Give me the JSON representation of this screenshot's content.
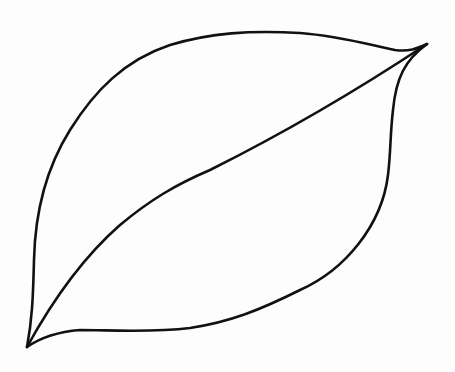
{
  "drawing": {
    "subject": "leaf outline with midrib",
    "style": "black line art on white",
    "colors": {
      "background": "#fdfdfd",
      "stroke": "#111111"
    },
    "stroke_width": 2.6,
    "tips": {
      "top_right": [
        427,
        44
      ],
      "bottom_left": [
        27,
        347
      ]
    }
  }
}
